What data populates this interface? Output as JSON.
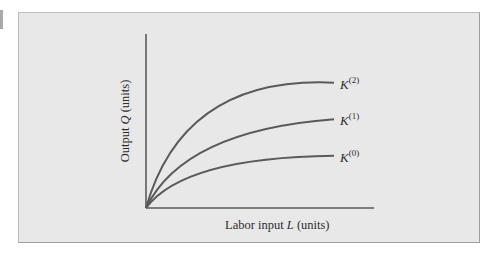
{
  "figure": {
    "background": "#e8e8e8",
    "line_color": "#5a5a5a"
  },
  "chart_data": {
    "type": "line",
    "title": "",
    "xlabel": "Labor input L (units)",
    "ylabel": "Output Q (units)",
    "xlabel_parts": {
      "pre": "Labor input ",
      "var": "L",
      "post": " (units)"
    },
    "ylabel_parts": {
      "pre": "Output ",
      "var": "Q",
      "post": " (units)"
    },
    "x_ticks": [],
    "y_ticks": [],
    "grid": false,
    "legend": "inline labels at curve ends",
    "series": [
      {
        "name": "K(2)",
        "label_base": "K",
        "label_sup": "(2)",
        "x": [
          0,
          0.35,
          1.0
        ],
        "y": [
          0,
          0.56,
          0.72
        ]
      },
      {
        "name": "K(1)",
        "label_base": "K",
        "label_sup": "(1)",
        "x": [
          0,
          0.35,
          1.0
        ],
        "y": [
          0,
          0.35,
          0.51
        ]
      },
      {
        "name": "K(0)",
        "label_base": "K",
        "label_sup": "(0)",
        "x": [
          0,
          0.35,
          1.0
        ],
        "y": [
          0,
          0.22,
          0.3
        ]
      }
    ],
    "xlim": [
      0,
      1.0
    ],
    "ylim": [
      0,
      1.0
    ]
  }
}
